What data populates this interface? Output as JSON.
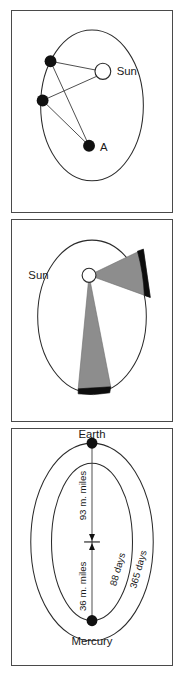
{
  "figure": {
    "panels": [
      {
        "id": "orbit-foci",
        "caption": "Elliptical orbit with Sun at one focus and point A at the other",
        "labels": {
          "sun": "Sun",
          "focus_a": "A"
        },
        "geometry": {
          "ellipse": {
            "cx": 81,
            "cy": 94,
            "rx": 52,
            "ry": 75
          },
          "sun": {
            "x": 92,
            "y": 60,
            "r": 8
          },
          "focus_a": {
            "x": 78,
            "y": 134,
            "r": 6
          },
          "planet_points": [
            {
              "x": 39,
              "y": 50,
              "r": 6
            },
            {
              "x": 31,
              "y": 89,
              "r": 6
            }
          ]
        }
      },
      {
        "id": "equal-areas",
        "caption": "Equal areas swept in equal times by the radius vector from the Sun",
        "labels": {
          "sun": "Sun"
        },
        "geometry": {
          "ellipse": {
            "cx": 81,
            "cy": 96,
            "rx": 55,
            "ry": 76
          },
          "sun": {
            "x": 78,
            "y": 55,
            "r": 7
          },
          "sectors": [
            {
              "name": "upper-right-sector",
              "start_deg": -38,
              "end_deg": 8
            },
            {
              "name": "lower-sector",
              "start_deg": 74,
              "end_deg": 98
            }
          ]
        }
      },
      {
        "id": "periods",
        "caption": "Orbits of Mercury and Earth with mean distances and orbital periods",
        "labels": {
          "outer_planet": "Earth",
          "inner_planet": "Mercury",
          "earth_distance": "93 m. miles",
          "mercury_distance": "36 m. miles",
          "mercury_period": "88 days",
          "earth_period": "365 days"
        },
        "geometry": {
          "outer_ellipse": {
            "cx": 81,
            "cy": 112,
            "rx": 62,
            "ry": 98
          },
          "inner_ellipse": {
            "cx": 81,
            "cy": 112,
            "rx": 41,
            "ry": 78
          },
          "sun": {
            "x": 81,
            "y": 112
          },
          "outer_planet_dot": {
            "x": 81,
            "y": 14,
            "r": 5.5
          },
          "inner_planet_dot": {
            "x": 81,
            "y": 190,
            "r": 5.5
          }
        }
      }
    ]
  },
  "colors": {
    "panel_border": "#4a4a4a",
    "orbit_stroke": "#2b2b2b",
    "body_fill": "#111111",
    "sector_fill": "#8d8d8d",
    "sector_cap": "#0d0d0d",
    "background": "#ffffff",
    "text": "#1a1a1a"
  }
}
